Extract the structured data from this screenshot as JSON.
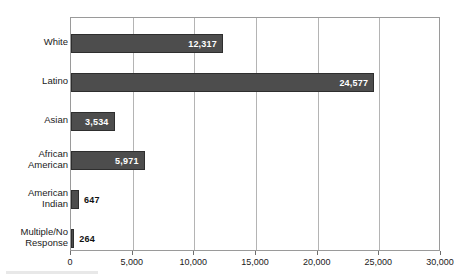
{
  "chart_data": {
    "type": "bar",
    "orientation": "horizontal",
    "title": "",
    "subtitle": "",
    "xlabel": "",
    "ylabel": "",
    "categories": [
      "White",
      "Latino",
      "Asian",
      "African\nAmerican",
      "American\nIndian",
      "Multiple/No\nResponse"
    ],
    "values": [
      12317,
      24577,
      3534,
      5971,
      647,
      264
    ],
    "value_labels": [
      "12,317",
      "24,577",
      "3,534",
      "5,971",
      "647",
      "264"
    ],
    "label_placement": [
      "inside",
      "inside",
      "inside",
      "inside",
      "outside",
      "outside"
    ],
    "xlim": [
      0,
      30000
    ],
    "xticks": [
      0,
      5000,
      10000,
      15000,
      20000,
      25000,
      30000
    ],
    "xtick_labels": [
      "0",
      "5,000",
      "10,000",
      "15,000",
      "20,000",
      "25,000",
      "30,000"
    ],
    "grid": {
      "vertical": true,
      "horizontal": false
    },
    "legend": null,
    "colors": {
      "bar_fill": "#4d4d4d",
      "bar_border": "#2e2e2e",
      "gridline": "#b4b4b4",
      "axis": "#9a9a9a",
      "inside_label": "#ffffff",
      "outside_label": "#111111",
      "background": "#ffffff"
    }
  }
}
